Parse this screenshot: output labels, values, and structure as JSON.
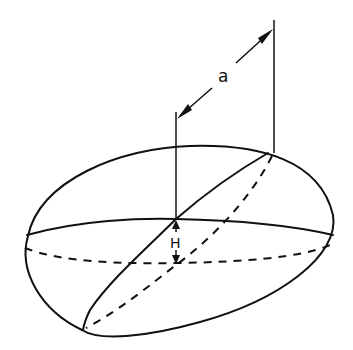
{
  "figure": {
    "labels": {
      "semi_axis": "a",
      "height": "H"
    },
    "line_color": "#111111",
    "background": "#ffffff"
  }
}
